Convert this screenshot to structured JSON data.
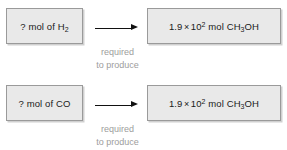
{
  "diagram": {
    "type": "stoichiometry-flow",
    "colors": {
      "box_fill": "#e9e9e9",
      "box_border": "#9a9a9a",
      "text": "#1a1a1a",
      "caption_text": "#9d9d9d",
      "arrow": "#111111",
      "background": "#ffffff"
    },
    "rows": [
      {
        "id": "row-h2",
        "left_box": {
          "prefix": "? mol of ",
          "species": "H",
          "species_sub": "2",
          "full_text": "? mol of H2"
        },
        "arrow": {
          "glyph": "right-arrow",
          "caption_line_1": "required",
          "caption_line_2": "to produce"
        },
        "right_box": {
          "coefficient": "1.9",
          "times": "×",
          "base": "10",
          "exponent": "2",
          "unit": "mol",
          "compound_part_1": "CH",
          "compound_sub": "3",
          "compound_part_2": "OH",
          "full_text": "1.9 × 10^2 mol CH3OH"
        }
      },
      {
        "id": "row-co",
        "left_box": {
          "prefix": "? mol of ",
          "species": "CO",
          "species_sub": "",
          "full_text": "? mol of CO"
        },
        "arrow": {
          "glyph": "right-arrow",
          "caption_line_1": "required",
          "caption_line_2": "to produce"
        },
        "right_box": {
          "coefficient": "1.9",
          "times": "×",
          "base": "10",
          "exponent": "2",
          "unit": "mol",
          "compound_part_1": "CH",
          "compound_sub": "3",
          "compound_part_2": "OH",
          "full_text": "1.9 × 10^2 mol CH3OH"
        }
      }
    ]
  }
}
